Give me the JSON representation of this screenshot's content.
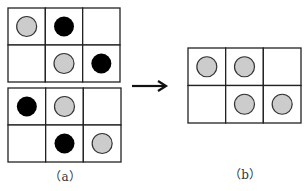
{
  "figure": {
    "panels": [
      {
        "id": "a-top",
        "rows": 2,
        "cols": 3,
        "cells": [
          [
            "gray",
            "black",
            "empty"
          ],
          [
            "empty",
            "gray",
            "black"
          ]
        ]
      },
      {
        "id": "a-bottom",
        "rows": 2,
        "cols": 3,
        "cells": [
          [
            "black",
            "gray",
            "empty"
          ],
          [
            "empty",
            "black",
            "gray"
          ]
        ]
      },
      {
        "id": "b",
        "rows": 2,
        "cols": 3,
        "cells": [
          [
            "gray",
            "gray",
            "empty"
          ],
          [
            "empty",
            "gray",
            "gray"
          ]
        ]
      }
    ],
    "arrow": "right-arrow",
    "captions": {
      "a": "（a）",
      "b": "（b）"
    },
    "colors": {
      "gray": "#cccccc",
      "black": "#000000",
      "grid": "#222222"
    }
  }
}
